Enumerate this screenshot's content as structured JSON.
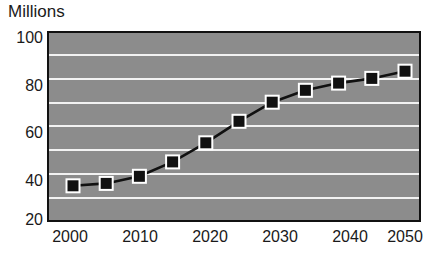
{
  "chart_data": {
    "type": "line",
    "title": "Millions",
    "subtitle": "",
    "xlabel": "",
    "ylabel": "",
    "ylim": [
      20,
      100
    ],
    "xlim": [
      2000,
      2050
    ],
    "grid": true,
    "legend": false,
    "legend_position": "none",
    "y_ticks": [
      20,
      40,
      60,
      80,
      100
    ],
    "y_tick_labels": [
      "20",
      "40",
      "60",
      "80",
      "100"
    ],
    "y_gridline_values": [
      30,
      40,
      50,
      60,
      70,
      80,
      90
    ],
    "x_ticks": [
      2000,
      2010,
      2020,
      2030,
      2040,
      2050
    ],
    "x_tick_labels": [
      "2000",
      "2010",
      "2020",
      "2030",
      "2040",
      "2050"
    ],
    "x": [
      2000,
      2005,
      2010,
      2015,
      2020,
      2025,
      2030,
      2035,
      2040,
      2045,
      2050
    ],
    "values": [
      36,
      37,
      40,
      46,
      54,
      63,
      71,
      76,
      79,
      81,
      84
    ],
    "marker": "square",
    "colors": {
      "plot_background": "#8c8c8c",
      "gridline": "#f2f2f2",
      "frame": "#111111",
      "line": "#111111",
      "marker_fill": "#111111",
      "marker_edge": "#ffffff",
      "text": "#1a1a1a",
      "page_background": "#ffffff"
    }
  }
}
